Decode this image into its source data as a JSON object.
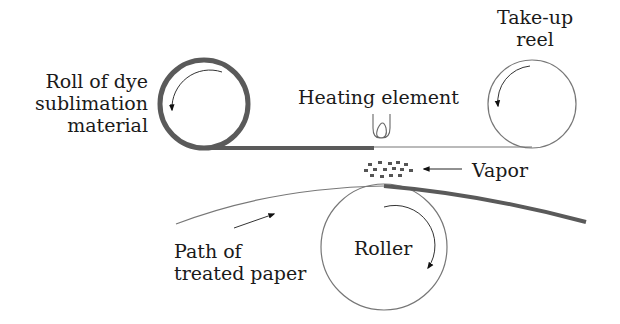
{
  "diagram": {
    "type": "dye sublimation printing process",
    "labels": {
      "supply_roll": [
        "Roll of dye",
        "sublimation",
        "material"
      ],
      "takeup_reel": [
        "Take-up",
        "reel"
      ],
      "heating_element": "Heating element",
      "vapor": "Vapor",
      "roller": "Roller",
      "paper_path": [
        "Path of",
        "treated paper"
      ]
    },
    "colors": {
      "ink": "#1a1a1a",
      "thick_line": "#5a5a5a",
      "thin_line": "#777777",
      "background": "#ffffff"
    }
  }
}
